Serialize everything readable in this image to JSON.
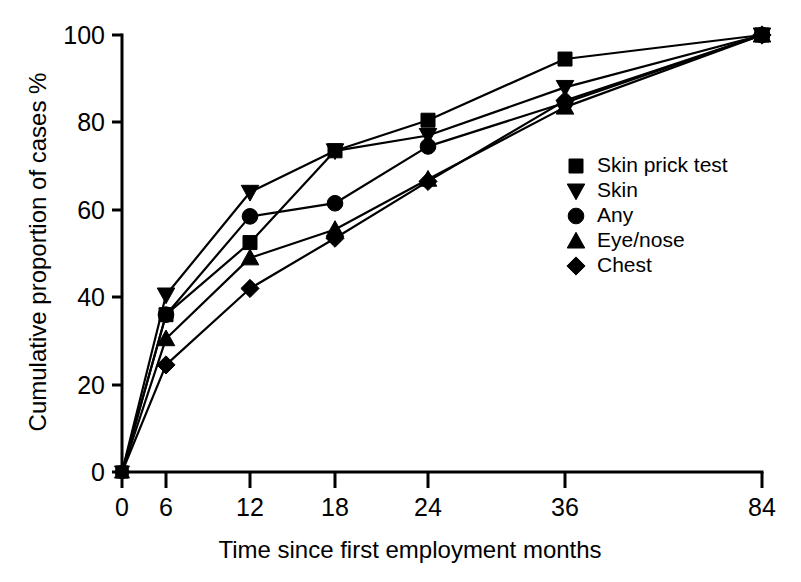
{
  "chart_data": {
    "type": "line",
    "title": "",
    "xlabel": "Time since first employment months",
    "ylabel": "Cumulative proportion of cases %",
    "categories": [
      "0",
      "6",
      "12",
      "18",
      "24",
      "36",
      "84"
    ],
    "x": [
      0,
      6,
      12,
      18,
      24,
      36,
      84
    ],
    "x_scale": "categorical-evenly-spaced",
    "xtick_labels": [
      "0",
      "6",
      "12",
      "18",
      "24",
      "36",
      "84"
    ],
    "ytick_labels": [
      "0",
      "20",
      "40",
      "60",
      "80",
      "100"
    ],
    "yticks": [
      0,
      20,
      40,
      60,
      80,
      100
    ],
    "ylim": [
      0,
      100
    ],
    "grid": false,
    "legend_position": "center-right",
    "series": [
      {
        "name": "Skin prick test",
        "marker": "square",
        "values": [
          0,
          36,
          52.5,
          73.5,
          80.5,
          94.5,
          100
        ]
      },
      {
        "name": "Skin",
        "marker": "triangle-down",
        "values": [
          0,
          40.5,
          64,
          73.5,
          77,
          88,
          100
        ]
      },
      {
        "name": "Any",
        "marker": "circle",
        "values": [
          0,
          36,
          58.5,
          61.5,
          74.5,
          84.5,
          100
        ]
      },
      {
        "name": "Eye/nose",
        "marker": "triangle-up",
        "values": [
          0,
          30.5,
          49,
          55.5,
          67,
          83.5,
          100
        ]
      },
      {
        "name": "Chest",
        "marker": "diamond",
        "values": [
          0,
          24.5,
          42,
          53.5,
          66.5,
          85,
          100
        ]
      }
    ]
  },
  "legend": {
    "items": [
      {
        "label": "Skin prick test",
        "marker": "square"
      },
      {
        "label": "Skin",
        "marker": "triangle-down"
      },
      {
        "label": "Any",
        "marker": "circle"
      },
      {
        "label": "Eye/nose",
        "marker": "triangle-up"
      },
      {
        "label": "Chest",
        "marker": "diamond"
      }
    ]
  },
  "colors": {
    "ink": "#000000",
    "background": "#ffffff"
  }
}
